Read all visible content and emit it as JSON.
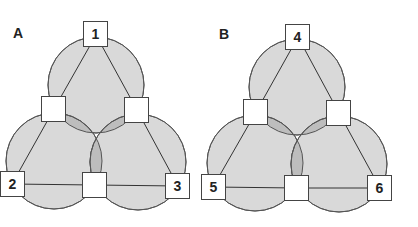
{
  "colors": {
    "fill": "#d9d9d9",
    "overlap": "#bdbdbd",
    "stroke": "#555555",
    "box": "#ffffff"
  },
  "panels": [
    {
      "label": "A",
      "nodes": {
        "top": "1",
        "left": "2",
        "right": "3",
        "mid_left": "",
        "mid_right": "",
        "mid_bottom": ""
      }
    },
    {
      "label": "B",
      "nodes": {
        "top": "4",
        "left": "5",
        "right": "6",
        "mid_left": "",
        "mid_right": "",
        "mid_bottom": ""
      }
    }
  ]
}
